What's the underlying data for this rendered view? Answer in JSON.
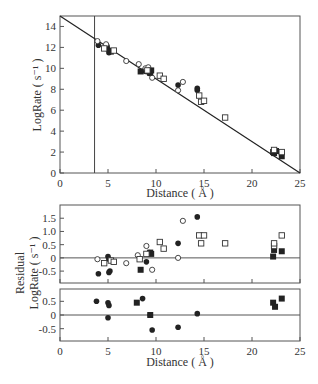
{
  "chart_data": [
    {
      "panel": "top",
      "type": "scatter",
      "title": "",
      "xlabel": "Distance ( Å )",
      "ylabel": "LogRate ( s⁻¹ )",
      "xlim": [
        0,
        25
      ],
      "ylim": [
        0,
        15
      ],
      "xticks": [
        0,
        5,
        10,
        15,
        20,
        25
      ],
      "yticks": [
        0,
        2,
        4,
        6,
        8,
        10,
        12,
        14
      ],
      "grid": false,
      "vertical_line_x": 3.6,
      "fit_line": {
        "x": [
          0,
          25
        ],
        "y": [
          15,
          0
        ]
      },
      "series": [
        {
          "name": "filled circles",
          "marker": "filled-circle",
          "points": [
            [
              4.0,
              12.2
            ],
            [
              4.9,
              12.1
            ],
            [
              5.0,
              11.8
            ],
            [
              5.1,
              11.5
            ],
            [
              5.2,
              11.7
            ],
            [
              8.9,
              9.7
            ],
            [
              9.3,
              9.5
            ],
            [
              12.3,
              8.4
            ],
            [
              14.3,
              8.1
            ],
            [
              14.3,
              7.9
            ]
          ]
        },
        {
          "name": "open circles",
          "marker": "open-circle",
          "points": [
            [
              3.9,
              12.6
            ],
            [
              4.8,
              12.3
            ],
            [
              6.9,
              10.7
            ],
            [
              8.2,
              10.4
            ],
            [
              8.9,
              10.0
            ],
            [
              9.2,
              10.1
            ],
            [
              9.6,
              9.1
            ],
            [
              12.3,
              7.9
            ],
            [
              12.8,
              8.7
            ]
          ]
        },
        {
          "name": "filled squares",
          "marker": "filled-square",
          "points": [
            [
              5.3,
              11.6
            ],
            [
              8.4,
              9.7
            ],
            [
              9.4,
              9.6
            ],
            [
              9.5,
              9.8
            ],
            [
              22.2,
              2.0
            ],
            [
              22.3,
              1.9
            ],
            [
              22.5,
              2.1
            ],
            [
              23.1,
              1.6
            ]
          ]
        },
        {
          "name": "open squares",
          "marker": "open-square",
          "points": [
            [
              4.6,
              11.9
            ],
            [
              5.6,
              11.7
            ],
            [
              9.1,
              9.8
            ],
            [
              10.4,
              9.3
            ],
            [
              10.8,
              9.0
            ],
            [
              14.5,
              7.4
            ],
            [
              14.7,
              6.8
            ],
            [
              15.0,
              6.9
            ],
            [
              17.2,
              5.3
            ],
            [
              22.3,
              2.2
            ],
            [
              23.1,
              2.0
            ]
          ]
        }
      ]
    },
    {
      "panel": "middle",
      "type": "scatter",
      "xlabel": "",
      "ylabel": "Residual LogRate ( s⁻¹ )",
      "xlim": [
        0,
        25
      ],
      "ylim": [
        -0.95,
        2.0
      ],
      "yticks": [
        -0.5,
        0,
        0.5,
        1.0,
        1.5
      ],
      "ytick_labels": [
        "-0.5",
        "0",
        "0.5",
        "1.0",
        "1.5"
      ],
      "zero_line": true,
      "series": [
        {
          "name": "filled circles",
          "marker": "filled-circle",
          "points": [
            [
              4.0,
              -0.6
            ],
            [
              5.0,
              0.05
            ],
            [
              5.1,
              -0.05
            ],
            [
              5.2,
              -0.5
            ],
            [
              5.1,
              -0.55
            ],
            [
              9.0,
              -0.15
            ],
            [
              9.3,
              0.2
            ],
            [
              12.3,
              0.55
            ],
            [
              14.3,
              1.55
            ]
          ]
        },
        {
          "name": "open circles",
          "marker": "open-circle",
          "points": [
            [
              3.9,
              -0.05
            ],
            [
              6.9,
              -0.2
            ],
            [
              8.1,
              0.1
            ],
            [
              9.0,
              0.45
            ],
            [
              9.6,
              -0.45
            ],
            [
              12.3,
              0.0
            ],
            [
              12.8,
              1.4
            ]
          ]
        },
        {
          "name": "filled squares",
          "marker": "filled-square",
          "points": [
            [
              8.4,
              -0.45
            ],
            [
              9.4,
              0.2
            ],
            [
              9.5,
              0.15
            ],
            [
              22.2,
              0.05
            ],
            [
              22.3,
              0.3
            ],
            [
              23.1,
              0.25
            ]
          ]
        },
        {
          "name": "open squares",
          "marker": "open-square",
          "points": [
            [
              4.6,
              -0.2
            ],
            [
              5.3,
              -0.1
            ],
            [
              5.6,
              -0.15
            ],
            [
              8.3,
              -0.05
            ],
            [
              9.0,
              0.15
            ],
            [
              10.4,
              0.6
            ],
            [
              10.8,
              0.35
            ],
            [
              14.5,
              0.85
            ],
            [
              14.7,
              0.55
            ],
            [
              15.0,
              0.85
            ],
            [
              17.2,
              0.55
            ],
            [
              22.3,
              0.45
            ],
            [
              22.3,
              0.55
            ],
            [
              23.1,
              0.85
            ]
          ]
        }
      ]
    },
    {
      "panel": "bottom",
      "type": "scatter",
      "xlabel": "Distance ( Å )",
      "ylabel": "",
      "xlim": [
        0,
        25
      ],
      "ylim": [
        -0.95,
        0.95
      ],
      "xticks": [
        0,
        5,
        10,
        15,
        20,
        25
      ],
      "yticks": [
        -0.5,
        0,
        0.5
      ],
      "ytick_labels": [
        "-0.5",
        "0",
        "0.5"
      ],
      "zero_line": true,
      "series": [
        {
          "name": "filled circles",
          "marker": "filled-circle",
          "points": [
            [
              3.8,
              0.5
            ],
            [
              5.0,
              0.45
            ],
            [
              5.1,
              0.35
            ],
            [
              5.0,
              -0.1
            ],
            [
              8.6,
              0.6
            ],
            [
              9.4,
              0.0
            ],
            [
              9.6,
              -0.55
            ],
            [
              12.3,
              -0.45
            ],
            [
              14.3,
              0.05
            ]
          ]
        },
        {
          "name": "filled squares",
          "marker": "filled-square",
          "points": [
            [
              8.0,
              0.45
            ],
            [
              9.4,
              0.0
            ],
            [
              22.2,
              0.45
            ],
            [
              22.4,
              0.3
            ],
            [
              23.1,
              0.6
            ]
          ]
        }
      ]
    }
  ],
  "labels": {
    "top_xlabel": "Distance ( Å )",
    "top_ylabel": "LogRate ( s⁻¹ )",
    "residual_ylabel_line1": "Residual",
    "residual_ylabel_line2": "LogRate ( s⁻¹ )",
    "bottom_xlabel": "Distance ( Å )"
  }
}
